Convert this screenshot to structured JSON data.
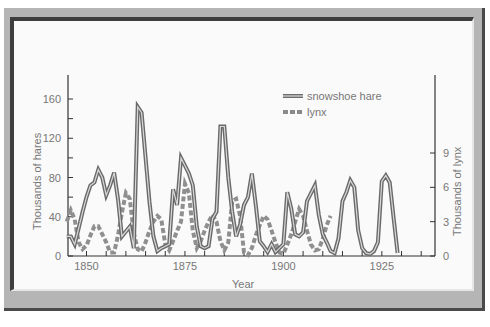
{
  "chart_data": {
    "type": "line",
    "title": "",
    "xlabel": "Year",
    "ylabel": "Thousands of hares",
    "ylabel_right": "Thousands of lynx",
    "xlim": [
      1845,
      1938
    ],
    "ylim": [
      0,
      180
    ],
    "ylim_right": [
      0,
      13.8
    ],
    "xticks": [
      1850,
      1875,
      1900,
      1925
    ],
    "yticks": [
      0,
      40,
      80,
      120,
      160
    ],
    "yticks_right": [
      0,
      3,
      6,
      9
    ],
    "grid": false,
    "legend_position": "upper right",
    "series": [
      {
        "name": "snowshoe hare",
        "axis": "left",
        "style": "double-solid",
        "x": [
          1845,
          1846,
          1847,
          1848,
          1849,
          1850,
          1851,
          1852,
          1853,
          1854,
          1855,
          1856,
          1857,
          1858,
          1859,
          1860,
          1861,
          1862,
          1863,
          1864,
          1865,
          1866,
          1867,
          1868,
          1869,
          1870,
          1871,
          1872,
          1873,
          1874,
          1875,
          1876,
          1877,
          1878,
          1879,
          1880,
          1881,
          1882,
          1883,
          1884,
          1885,
          1886,
          1887,
          1888,
          1889,
          1890,
          1891,
          1892,
          1893,
          1894,
          1895,
          1896,
          1897,
          1898,
          1899,
          1900,
          1901,
          1902,
          1903,
          1904,
          1905,
          1906,
          1907,
          1908,
          1909,
          1910,
          1911,
          1912,
          1913,
          1914,
          1915,
          1916,
          1917,
          1918,
          1919,
          1920,
          1921,
          1922,
          1923,
          1924,
          1925,
          1926,
          1927,
          1928,
          1929,
          1930,
          1931,
          1932,
          1933,
          1934,
          1935,
          1936,
          1937,
          1938
        ],
        "values": [
          20,
          20,
          12,
          28,
          45,
          60,
          72,
          75,
          88,
          80,
          62,
          72,
          85,
          58,
          20,
          25,
          30,
          8,
          152,
          146,
          100,
          55,
          20,
          5,
          8,
          10,
          12,
          68,
          52,
          100,
          92,
          84,
          72,
          30,
          10,
          8,
          10,
          38,
          45,
          132,
          132,
          80,
          45,
          20,
          32,
          52,
          60,
          84,
          52,
          15,
          10,
          4,
          12,
          4,
          8,
          12,
          65,
          48,
          22,
          20,
          24,
          56,
          64,
          72,
          42,
          22,
          14,
          5,
          3,
          18,
          56,
          65,
          77,
          70,
          26,
          8,
          3,
          2,
          5,
          14,
          76,
          82,
          75,
          38,
          3,
          0,
          0,
          0,
          0,
          0,
          0,
          0,
          0,
          0
        ],
        "note": "Approximate; values read off pixel positions of the plotted line."
      },
      {
        "name": "lynx",
        "axis": "right",
        "style": "dashed",
        "x": [
          1845,
          1846,
          1847,
          1848,
          1849,
          1850,
          1851,
          1852,
          1853,
          1854,
          1855,
          1856,
          1857,
          1858,
          1859,
          1860,
          1861,
          1862,
          1863,
          1864,
          1865,
          1866,
          1867,
          1868,
          1869,
          1870,
          1871,
          1872,
          1873,
          1874,
          1875,
          1876,
          1877,
          1878,
          1879,
          1880,
          1881,
          1882,
          1883,
          1884,
          1885,
          1886,
          1887,
          1888,
          1889,
          1890,
          1891,
          1892,
          1893,
          1894,
          1895,
          1896,
          1897,
          1898,
          1899,
          1900,
          1901,
          1902,
          1903,
          1904,
          1905,
          1906,
          1907,
          1908,
          1909,
          1910,
          1911,
          1912,
          1913,
          1914,
          1915,
          1916,
          1917,
          1918,
          1919,
          1920,
          1921,
          1922,
          1923,
          1924,
          1925,
          1926,
          1927,
          1928,
          1929,
          1930,
          1931,
          1932,
          1933,
          1934,
          1935,
          1936,
          1937
        ],
        "values": [
          3.0,
          4.0,
          3.2,
          1.2,
          0.6,
          0.9,
          1.8,
          2.6,
          2.6,
          1.9,
          1.2,
          0.3,
          0.3,
          1.8,
          3.8,
          5.5,
          5.0,
          2.0,
          0.6,
          0.4,
          1.2,
          2.2,
          3.0,
          3.5,
          3.2,
          1.0,
          0.5,
          1.3,
          2.2,
          3.0,
          6.3,
          5.5,
          2.2,
          0.7,
          1.3,
          2.2,
          3.0,
          3.6,
          3.0,
          1.3,
          0.5,
          1.2,
          4.8,
          5.0,
          3.5,
          0.3,
          0.1,
          0.7,
          1.8,
          2.7,
          3.5,
          3.2,
          2.2,
          1.2,
          0.3,
          0.2,
          1.0,
          1.9,
          3.0,
          4.1,
          3.5,
          2.2,
          1.0,
          0.5,
          0.6,
          1.5,
          2.7,
          3.5,
          0,
          0,
          0,
          0,
          0,
          0,
          0,
          0,
          0,
          0,
          0,
          0,
          0,
          0,
          0,
          0,
          0,
          0,
          0,
          0,
          0,
          0,
          0,
          0,
          0
        ],
        "note": "Approximate; values read off pixel positions of the plotted line."
      }
    ]
  }
}
